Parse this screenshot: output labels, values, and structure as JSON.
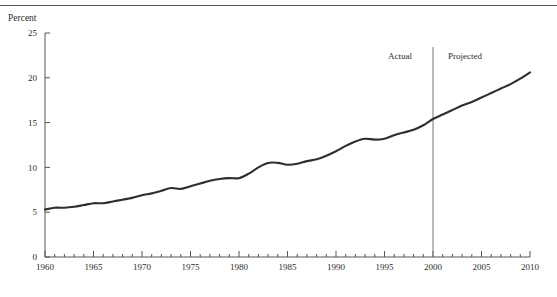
{
  "figure": {
    "has_top_rule": true,
    "axis_title": "Percent",
    "line_color": "#2e2e2e",
    "axis_color": "#555555",
    "divider_color": "#777777",
    "text_color": "#2b2b2b"
  },
  "annotations": {
    "actual_label": "Actual",
    "projected_label": "Projected",
    "divider_year": 2000
  },
  "chart_data": {
    "type": "line",
    "title": "",
    "subtitle": "",
    "xlabel": "",
    "ylabel": "Percent",
    "xlim": [
      1960,
      2010
    ],
    "ylim": [
      0,
      25
    ],
    "yticks": [
      0,
      5,
      10,
      15,
      20,
      25
    ],
    "ytick_labels": [
      "0",
      "5",
      "10",
      "15",
      "20",
      "25"
    ],
    "xticks": [
      1960,
      1965,
      1970,
      1975,
      1980,
      1985,
      1990,
      1995,
      2000,
      2005,
      2010
    ],
    "xtick_labels": [
      "1960",
      "1965",
      "1970",
      "1975",
      "1980",
      "1985",
      "1990",
      "1995",
      "2000",
      "2005",
      "2010"
    ],
    "x_minor_tick_interval": 1,
    "grid": false,
    "legend": null,
    "annotations": [
      {
        "text": "Actual",
        "x": 1995.5,
        "y": 23.0
      },
      {
        "text": "Projected",
        "x": 2003.0,
        "y": 23.0
      },
      {
        "type": "vline",
        "x": 2000,
        "label": "actual-projected divider"
      }
    ],
    "series": [
      {
        "name": "Percent",
        "x": [
          1960,
          1961,
          1962,
          1963,
          1964,
          1965,
          1966,
          1967,
          1968,
          1969,
          1970,
          1971,
          1972,
          1973,
          1974,
          1975,
          1976,
          1977,
          1978,
          1979,
          1980,
          1981,
          1982,
          1983,
          1984,
          1985,
          1986,
          1987,
          1988,
          1989,
          1990,
          1991,
          1992,
          1993,
          1994,
          1995,
          1996,
          1997,
          1998,
          1999,
          2000,
          2001,
          2002,
          2003,
          2004,
          2005,
          2006,
          2007,
          2008,
          2009,
          2010
        ],
        "y": [
          5.3,
          5.5,
          5.5,
          5.6,
          5.8,
          6.0,
          6.0,
          6.2,
          6.4,
          6.6,
          6.9,
          7.1,
          7.4,
          7.7,
          7.6,
          7.9,
          8.2,
          8.5,
          8.7,
          8.8,
          8.8,
          9.3,
          10.0,
          10.5,
          10.5,
          10.3,
          10.4,
          10.7,
          10.9,
          11.3,
          11.8,
          12.4,
          12.9,
          13.2,
          13.1,
          13.2,
          13.6,
          13.9,
          14.2,
          14.7,
          15.4,
          15.9,
          16.4,
          16.9,
          17.3,
          17.8,
          18.3,
          18.8,
          19.3,
          19.9,
          20.6
        ]
      }
    ]
  }
}
